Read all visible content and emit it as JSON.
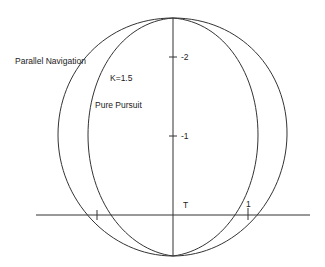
{
  "diagram": {
    "type": "trajectory-comparison",
    "curves": [
      {
        "name": "Parallel Navigation",
        "label": "Parallel Navigation",
        "shape": "closed oval (outer)"
      },
      {
        "name": "Pure Pursuit",
        "label": "Pure Pursuit",
        "shape": "closed oval (inner)"
      }
    ],
    "parameter_label": "K=1.5",
    "target_label": "T",
    "axes": {
      "vertical_ticks": [
        {
          "value": -2,
          "label": "-2"
        },
        {
          "value": -1,
          "label": "-1"
        }
      ],
      "horizontal_ticks": [
        {
          "value": -1,
          "label": ""
        },
        {
          "value": 1,
          "label": "1"
        }
      ]
    },
    "stroke_color": "#333333",
    "background": "#ffffff"
  }
}
